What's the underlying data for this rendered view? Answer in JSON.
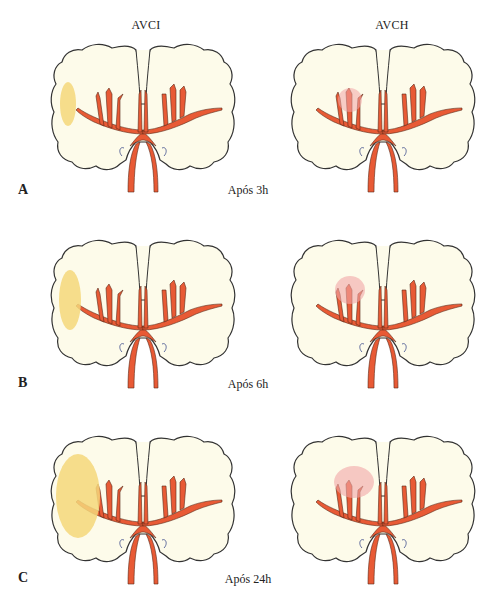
{
  "columns": [
    {
      "id": "ischemic",
      "title": "AVCI",
      "lesion_color": "#f5d77a"
    },
    {
      "id": "hemorrhagic",
      "title": "AVCH",
      "lesion_color": "#f2a6a6"
    }
  ],
  "rows": [
    {
      "label": "A",
      "time": "Após 3h",
      "ischemic_lesion": {
        "rx": 8,
        "ry": 22
      },
      "hemorrhagic_lesion": {
        "r": 12
      }
    },
    {
      "label": "B",
      "time": "Após 6h",
      "ischemic_lesion": {
        "rx": 11,
        "ry": 30
      },
      "hemorrhagic_lesion": {
        "r": 15
      }
    },
    {
      "label": "C",
      "time": "Após 24h",
      "ischemic_lesion": {
        "rx": 22,
        "ry": 42
      },
      "hemorrhagic_lesion": {
        "r": 20
      }
    }
  ],
  "colors": {
    "brain_fill": "#fdfbea",
    "brain_outline": "#333333",
    "artery": "#e85a35",
    "artery_outline": "#5a2a1a"
  }
}
